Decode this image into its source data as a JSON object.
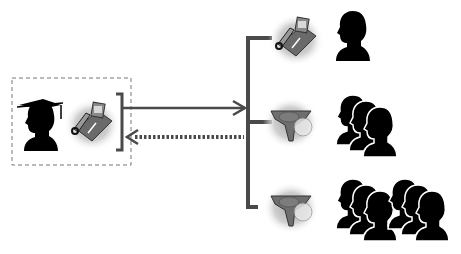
{
  "diagram": {
    "type": "conference-call-topology",
    "colors": {
      "line": "#4a4a4a",
      "dashed_box": "#777777",
      "silhouette": "#000000",
      "device_body": "#6e6e6e",
      "glow": "#b8b8b8",
      "background": "#ffffff"
    },
    "source": {
      "label": "",
      "icons": [
        "graduate-silhouette-icon",
        "desk-phone-icon"
      ]
    },
    "arrows": [
      {
        "direction": "to-endpoints",
        "style": "solid"
      },
      {
        "direction": "to-source",
        "style": "dotted"
      }
    ],
    "endpoints": [
      {
        "device": "desk-phone-icon",
        "people": 1
      },
      {
        "device": "conference-speakerphone-icon",
        "people": 3
      },
      {
        "device": "conference-speakerphone-icon",
        "people": 6
      }
    ]
  }
}
